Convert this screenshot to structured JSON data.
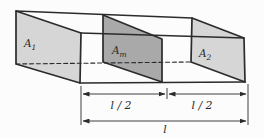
{
  "figure": {
    "labels": {
      "a1": {
        "base": "A",
        "sub": "1"
      },
      "am": {
        "base": "A",
        "sub": "m"
      },
      "a2": {
        "base": "A",
        "sub": "2"
      }
    },
    "dimensions": {
      "left_half": "l / 2",
      "right_half": "l / 2",
      "total": "l"
    },
    "colors": {
      "background": "#fcfcfc",
      "end_face": "#d6d6d6",
      "middle_face": "#a9a9a9",
      "line": "#2b2b2b"
    }
  }
}
